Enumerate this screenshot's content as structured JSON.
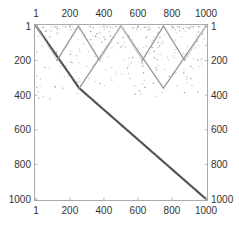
{
  "chart_data": {
    "type": "heatmap",
    "subtype": "sparse-matrix-plot",
    "title": "",
    "xlabel": "",
    "ylabel": "",
    "xlim": [
      1,
      1000
    ],
    "ylim": [
      1,
      1000
    ],
    "y_inverted": true,
    "grid": false,
    "legend": null,
    "x_ticks": [
      "1",
      "200",
      "400",
      "600",
      "800",
      "1000"
    ],
    "y_ticks": [
      "1",
      "200",
      "400",
      "600",
      "800",
      "1000"
    ],
    "x_tick_values": [
      1,
      200,
      400,
      600,
      800,
      1000
    ],
    "y_tick_values": [
      1,
      200,
      400,
      600,
      800,
      1000
    ],
    "ticks_on_all_sides": true,
    "colors": {
      "strong": "#555555",
      "medium": "#999999",
      "faint": "#c8c8c8",
      "frame": "#aaaaaa"
    },
    "line_segments": [
      {
        "from": [
          1,
          1
        ],
        "to": [
          255,
          360
        ],
        "strength": "strong"
      },
      {
        "from": [
          255,
          360
        ],
        "to": [
          1000,
          1000
        ],
        "strength": "strong"
      },
      {
        "from": [
          255,
          360
        ],
        "to": [
          500,
          1
        ],
        "strength": "medium"
      },
      {
        "from": [
          500,
          1
        ],
        "to": [
          750,
          360
        ],
        "strength": "medium"
      },
      {
        "from": [
          750,
          360
        ],
        "to": [
          1000,
          1
        ],
        "strength": "medium"
      },
      {
        "from": [
          1,
          1
        ],
        "to": [
          125,
          200
        ],
        "strength": "faint"
      },
      {
        "from": [
          125,
          200
        ],
        "to": [
          250,
          1
        ],
        "strength": "medium"
      },
      {
        "from": [
          250,
          1
        ],
        "to": [
          375,
          200
        ],
        "strength": "medium"
      },
      {
        "from": [
          375,
          200
        ],
        "to": [
          500,
          1
        ],
        "strength": "faint"
      },
      {
        "from": [
          500,
          1
        ],
        "to": [
          625,
          200
        ],
        "strength": "faint"
      },
      {
        "from": [
          625,
          200
        ],
        "to": [
          750,
          1
        ],
        "strength": "medium"
      },
      {
        "from": [
          750,
          1
        ],
        "to": [
          875,
          200
        ],
        "strength": "medium"
      },
      {
        "from": [
          875,
          200
        ],
        "to": [
          1000,
          1
        ],
        "strength": "faint"
      }
    ],
    "scatter_region_description": "sparse scattered faint points concentrated in y 1-150, thinning out to y≈400",
    "scatter_seed": 7,
    "scatter_count": 260
  }
}
